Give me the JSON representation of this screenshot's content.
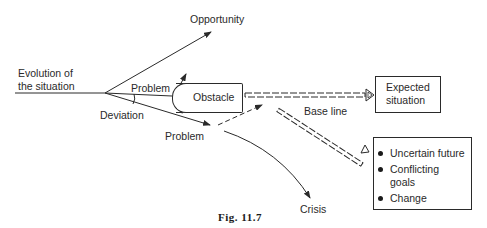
{
  "figure": {
    "caption": "Fig. 11.7",
    "labels": {
      "evolution_line1": "Evolution of",
      "evolution_line2": "the situation",
      "opportunity": "Opportunity",
      "problem_upper": "Problem",
      "deviation": "Deviation",
      "problem_lower": "Problem",
      "base_line": "Base line",
      "crisis": "Crisis"
    },
    "obstacle": {
      "label": "Obstacle"
    },
    "expected_box": {
      "line1": "Expected",
      "line2": "situation"
    },
    "factors_box": {
      "items": [
        {
          "label": "Uncertain future"
        },
        {
          "label": "Conflicting goals"
        },
        {
          "label": "Change"
        }
      ]
    },
    "colors": {
      "ink": "#2a2a2a",
      "background": "#ffffff"
    }
  }
}
